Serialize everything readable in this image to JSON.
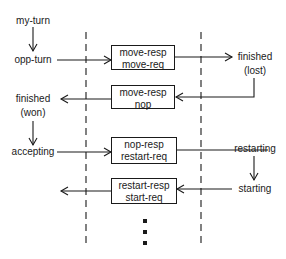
{
  "diagram": {
    "left_states": {
      "my_turn": "my-turn",
      "opp_turn": "opp-turn",
      "finished_won_1": "finished",
      "finished_won_2": "(won)",
      "accepting": "accepting"
    },
    "right_states": {
      "finished_lost_1": "finished",
      "finished_lost_2": "(lost)",
      "restarting": "restarting",
      "starting": "starting"
    },
    "messages": [
      {
        "line1": "move-resp",
        "line2": "move-req",
        "direction": "right"
      },
      {
        "line1": "move-resp",
        "line2": "nop",
        "direction": "left"
      },
      {
        "line1": "nop-resp",
        "line2": "restart-req",
        "direction": "right"
      },
      {
        "line1": "restart-resp",
        "line2": "start-req",
        "direction": "left"
      }
    ],
    "continuation": "⋮"
  },
  "colors": {
    "stroke": "#1a1a1a",
    "background": "#ffffff"
  }
}
